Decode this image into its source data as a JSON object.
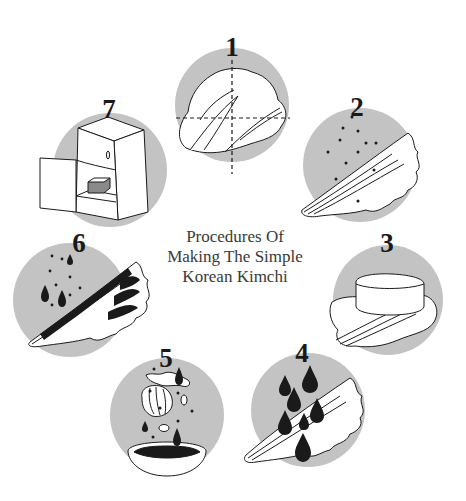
{
  "title": {
    "lines": [
      "Procedures Of",
      "Making The Simple",
      "Korean Kimchi"
    ]
  },
  "colors": {
    "circle_fill": "#c3c3c3",
    "line": "#1a1a1a",
    "white": "#ffffff",
    "box_fill": "#8a8a8a"
  },
  "steps": [
    {
      "number": "1",
      "icon": "cabbage-cut-icon",
      "cx": 232,
      "cy": 105
    },
    {
      "number": "2",
      "icon": "salted-cabbage-icon",
      "cx": 360,
      "cy": 165
    },
    {
      "number": "3",
      "icon": "weighted-cabbage-icon",
      "cx": 388,
      "cy": 300
    },
    {
      "number": "4",
      "icon": "rinsed-cabbage-icon",
      "cx": 308,
      "cy": 410
    },
    {
      "number": "5",
      "icon": "seasoning-bowl-icon",
      "cx": 167,
      "cy": 415
    },
    {
      "number": "6",
      "icon": "seasoned-cabbage-icon",
      "cx": 70,
      "cy": 300
    },
    {
      "number": "7",
      "icon": "refrigerator-icon",
      "cx": 110,
      "cy": 170
    }
  ]
}
